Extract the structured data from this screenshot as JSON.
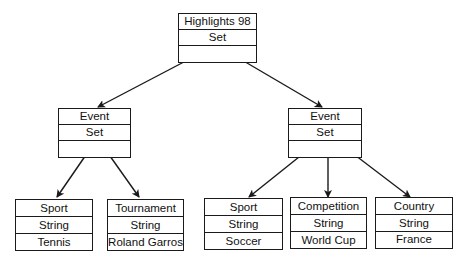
{
  "diagram": {
    "type": "tree",
    "nodes": {
      "root": {
        "rows": [
          "Highlights 98",
          "Set",
          ""
        ]
      },
      "event_left": {
        "rows": [
          "Event",
          "Set",
          ""
        ]
      },
      "event_right": {
        "rows": [
          "Event",
          "Set",
          ""
        ]
      },
      "leaf_sport_tennis": {
        "rows": [
          "Sport",
          "String",
          "Tennis"
        ]
      },
      "leaf_tournament": {
        "rows": [
          "Tournament",
          "String",
          "Roland Garros"
        ]
      },
      "leaf_sport_soccer": {
        "rows": [
          "Sport",
          "String",
          "Soccer"
        ]
      },
      "leaf_competition": {
        "rows": [
          "Competition",
          "String",
          "World Cup"
        ]
      },
      "leaf_country": {
        "rows": [
          "Country",
          "String",
          "France"
        ]
      }
    },
    "edges": [
      [
        "root",
        "event_left"
      ],
      [
        "root",
        "event_right"
      ],
      [
        "event_left",
        "leaf_sport_tennis"
      ],
      [
        "event_left",
        "leaf_tournament"
      ],
      [
        "event_right",
        "leaf_sport_soccer"
      ],
      [
        "event_right",
        "leaf_competition"
      ],
      [
        "event_right",
        "leaf_country"
      ]
    ],
    "colors": {
      "line": "#1a1a1a",
      "background": "#ffffff"
    }
  }
}
